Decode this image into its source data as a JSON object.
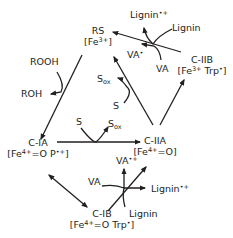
{
  "diagram": {
    "type": "catalytic-cycle",
    "stroke_color": "#231f20",
    "nodes": {
      "rs": {
        "name": "RS",
        "state_pre": "[Fe",
        "state_sup": "3+",
        "state_post": "]"
      },
      "c_ia": {
        "name": "C-IA",
        "state_pre": "[Fe",
        "state_sup": "4+",
        "state_mid": "=O P",
        "state_sup2": "•+",
        "state_post": "]"
      },
      "c_iia": {
        "name": "C-IIA",
        "state_pre": "[Fe",
        "state_sup": "4+",
        "state_post": "=O]"
      },
      "c_iib": {
        "name": "C-IIB",
        "state_pre": "[Fe",
        "state_sup": "3+",
        "state_mid": " Trp",
        "state_sup2": "•",
        "state_post": "]"
      },
      "c_ib": {
        "name": "C-IB",
        "state_pre": "[Fe",
        "state_sup": "4+",
        "state_mid": "=O Trp",
        "state_sup2": "•",
        "state_post": "]"
      }
    },
    "species": {
      "rooh": "ROOH",
      "roh": "ROH",
      "s_left": "S",
      "sox_left": "S",
      "sox_left_sub": "ox",
      "s_mid": "S",
      "sox_mid": "S",
      "sox_mid_sub": "ox",
      "va_top": "VA",
      "va_rad_top": "VA",
      "va_rad_top_sup": "•",
      "lignin_top": "Lignin",
      "lignin_rad_top": "Lignin",
      "lignin_rad_top_sup": "•+",
      "va_bottom": "VA",
      "va_rad_bottom": "VA",
      "va_rad_bottom_sup": "•+",
      "lignin_bottom": "Lignin",
      "lignin_rad_bottom": "Lignin",
      "lignin_rad_bottom_sup": "•+"
    },
    "edges": [
      {
        "from": "RS",
        "to": "C-IA",
        "with": "ROOH → ROH"
      },
      {
        "from": "C-IA",
        "to": "C-IIA",
        "with": "S → Sox"
      },
      {
        "from": "C-IIA",
        "to": "RS",
        "with": "S → Sox"
      },
      {
        "from": "C-IIA",
        "to": "C-IIB",
        "with": ""
      },
      {
        "from": "C-IIB",
        "to": "RS",
        "with": "VA → VA•, Lignin → Lignin•+"
      },
      {
        "from": "C-IA",
        "to": "C-IB",
        "with": "reversible"
      },
      {
        "from": "C-IB",
        "to": "C-IIA",
        "with": "VA → VA•+, Lignin → Lignin•+"
      }
    ]
  }
}
